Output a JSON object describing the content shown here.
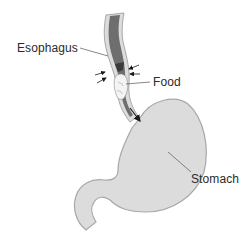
{
  "diagram": {
    "type": "anatomical-illustration",
    "labels": {
      "esophagus": "Esophagus",
      "food": "Food",
      "stomach": "Stomach"
    },
    "parts": [
      {
        "name": "esophagus",
        "description": "Tube with light-gray wall and dark-gray lumen"
      },
      {
        "name": "food-bolus",
        "description": "Light lump of food inside the esophagus"
      },
      {
        "name": "compression-arrows",
        "description": "Paired arrows on both sides showing muscular contraction"
      },
      {
        "name": "flow-arrow",
        "description": "Arrow pointing down into the stomach"
      },
      {
        "name": "stomach",
        "description": "J-shaped light-gray organ with duodenum curling down-left"
      }
    ],
    "colors": {
      "organ_fill": "#dcdcdc",
      "organ_outline": "#a8a8a8",
      "lumen": "#6e6e6e",
      "lumen_dark": "#3a3a3a",
      "food": "#f4f4f4",
      "text": "#2a2a2a",
      "leader_line": "#555555",
      "arrow": "#1a1a1a"
    }
  }
}
